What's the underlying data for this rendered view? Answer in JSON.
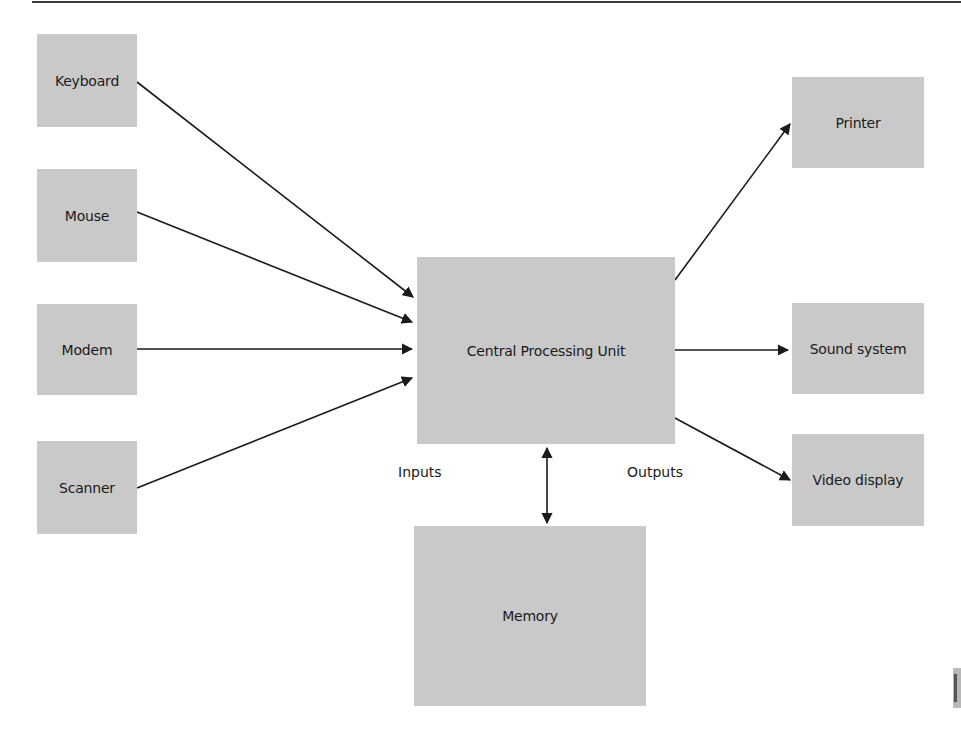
{
  "diagram": {
    "inputs": [
      {
        "id": "keyboard",
        "label": "Keyboard"
      },
      {
        "id": "mouse",
        "label": "Mouse"
      },
      {
        "id": "modem",
        "label": "Modem"
      },
      {
        "id": "scanner",
        "label": "Scanner"
      }
    ],
    "center": {
      "id": "cpu",
      "label": "Central Processing Unit"
    },
    "memory": {
      "id": "memory",
      "label": "Memory"
    },
    "outputs": [
      {
        "id": "printer",
        "label": "Printer"
      },
      {
        "id": "sound",
        "label": "Sound system"
      },
      {
        "id": "video",
        "label": "Video display"
      }
    ],
    "annotations": {
      "inputs_label": "Inputs",
      "outputs_label": "Outputs"
    },
    "edges": [
      {
        "from": "Keyboard",
        "to": "Central Processing Unit",
        "type": "arrow"
      },
      {
        "from": "Mouse",
        "to": "Central Processing Unit",
        "type": "arrow"
      },
      {
        "from": "Modem",
        "to": "Central Processing Unit",
        "type": "arrow"
      },
      {
        "from": "Scanner",
        "to": "Central Processing Unit",
        "type": "arrow"
      },
      {
        "from": "Central Processing Unit",
        "to": "Printer",
        "type": "arrow"
      },
      {
        "from": "Central Processing Unit",
        "to": "Sound system",
        "type": "arrow"
      },
      {
        "from": "Central Processing Unit",
        "to": "Video display",
        "type": "arrow"
      },
      {
        "from": "Central Processing Unit",
        "to": "Memory",
        "type": "bidirectional"
      }
    ],
    "colors": {
      "box": "#c9c9c9",
      "line": "#1a1a1a"
    }
  }
}
